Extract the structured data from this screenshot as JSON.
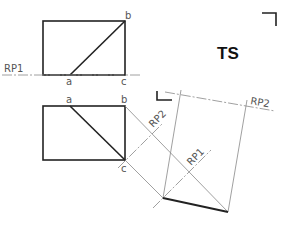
{
  "diagram": {
    "title": "TS",
    "colors": {
      "thick": "#222222",
      "thin": "#888888",
      "label": "#555555"
    },
    "top_view": {
      "labels": {
        "a": "a",
        "b": "b",
        "c": "c",
        "ref_plane": "RP1"
      }
    },
    "front_view": {
      "labels": {
        "a": "a",
        "b": "b",
        "c": "c"
      }
    },
    "auxiliary": {
      "ref_plane_1": "RP1",
      "ref_plane_2_diag": "RP2",
      "ref_plane_2_top": "RP2"
    }
  }
}
